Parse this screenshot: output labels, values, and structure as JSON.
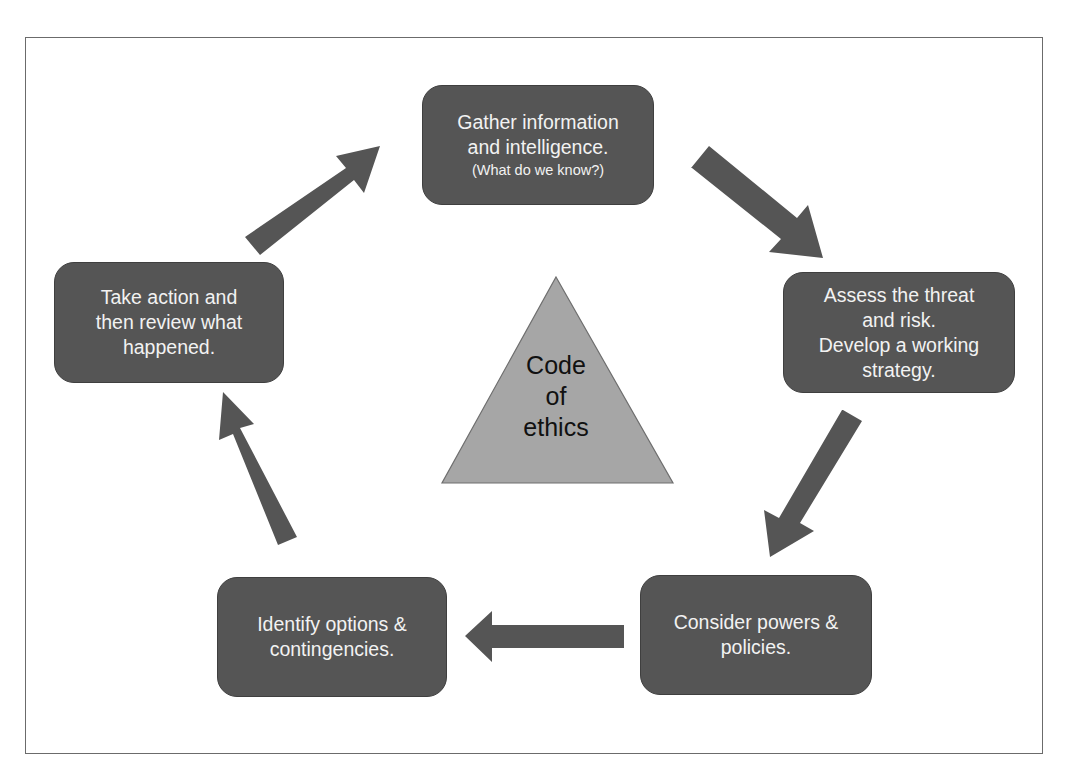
{
  "diagram": {
    "type": "cycle",
    "colors": {
      "box_fill": "#555555",
      "box_text": "#f2f2f2",
      "arrow_fill": "#555555",
      "triangle_fill": "#a6a6a6",
      "triangle_text": "#111111",
      "frame_border": "#6b6b6b"
    },
    "center": {
      "shape": "triangle",
      "lines": [
        "Code",
        "of",
        "ethics"
      ]
    },
    "steps": [
      {
        "id": "gather",
        "lines": [
          "Gather information",
          "and intelligence."
        ],
        "subtext": "(What do we know?)"
      },
      {
        "id": "assess",
        "lines": [
          "Assess the threat",
          "and risk.",
          "Develop a working",
          "strategy."
        ]
      },
      {
        "id": "consider",
        "lines": [
          "Consider powers &",
          "policies."
        ]
      },
      {
        "id": "identify",
        "lines": [
          "Identify options &",
          "contingencies."
        ]
      },
      {
        "id": "action",
        "lines": [
          "Take action and",
          "then review what",
          "happened."
        ]
      }
    ],
    "edges": [
      {
        "from": "gather",
        "to": "assess"
      },
      {
        "from": "assess",
        "to": "consider"
      },
      {
        "from": "consider",
        "to": "identify"
      },
      {
        "from": "identify",
        "to": "action"
      },
      {
        "from": "action",
        "to": "gather"
      }
    ]
  }
}
